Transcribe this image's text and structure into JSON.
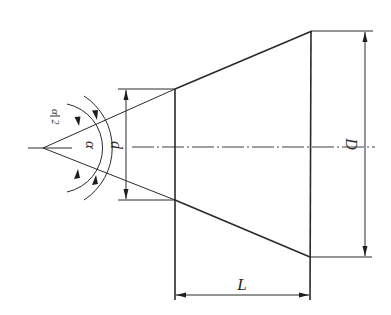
{
  "figure": {
    "labels": {
      "half_angle": "α/2",
      "half_angle_num": "α",
      "half_angle_den": "2",
      "angle": "α",
      "small_diameter": "d",
      "large_diameter": "D",
      "length": "L"
    },
    "colors": {
      "ink": "#2a2a2a",
      "background": "#ffffff"
    }
  }
}
